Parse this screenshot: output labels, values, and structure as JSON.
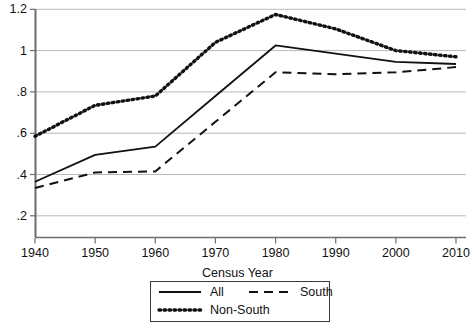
{
  "chart_data": {
    "type": "line",
    "title": "",
    "xlabel": "Census Year",
    "ylabel": "",
    "x": [
      1940,
      1950,
      1960,
      1970,
      1980,
      1990,
      2000,
      2010
    ],
    "xtick_labels": [
      "1940",
      "1950",
      "1960",
      "1970",
      "1980",
      "1990",
      "2000",
      "2010"
    ],
    "ytick_labels": [
      "1.2",
      "1",
      ".8",
      ".6",
      ".4",
      ".2"
    ],
    "yticks": [
      1.2,
      1.0,
      0.8,
      0.6,
      0.4,
      0.2
    ],
    "xlim": [
      1940,
      2010
    ],
    "ylim": [
      0.083,
      1.23
    ],
    "grid": "horizontal",
    "legend_position": "below-axes",
    "series": [
      {
        "name": "All",
        "style": "solid",
        "color": "#111111",
        "values": [
          0.365,
          0.495,
          0.535,
          0.78,
          1.025,
          0.985,
          0.945,
          0.935
        ]
      },
      {
        "name": "South",
        "style": "dashed",
        "color": "#111111",
        "values": [
          0.335,
          0.41,
          0.415,
          0.655,
          0.895,
          0.885,
          0.895,
          0.92
        ]
      },
      {
        "name": "Non-South",
        "style": "dotted",
        "color": "#111111",
        "values": [
          0.585,
          0.735,
          0.78,
          1.04,
          1.175,
          1.105,
          1.0,
          0.97
        ]
      }
    ]
  },
  "axis": {
    "xlabel": "Census Year"
  },
  "legend": {
    "entries": [
      {
        "label": "All",
        "style": "solid"
      },
      {
        "label": "South",
        "style": "dashed"
      },
      {
        "label": "Non-South",
        "style": "dotted"
      }
    ]
  }
}
